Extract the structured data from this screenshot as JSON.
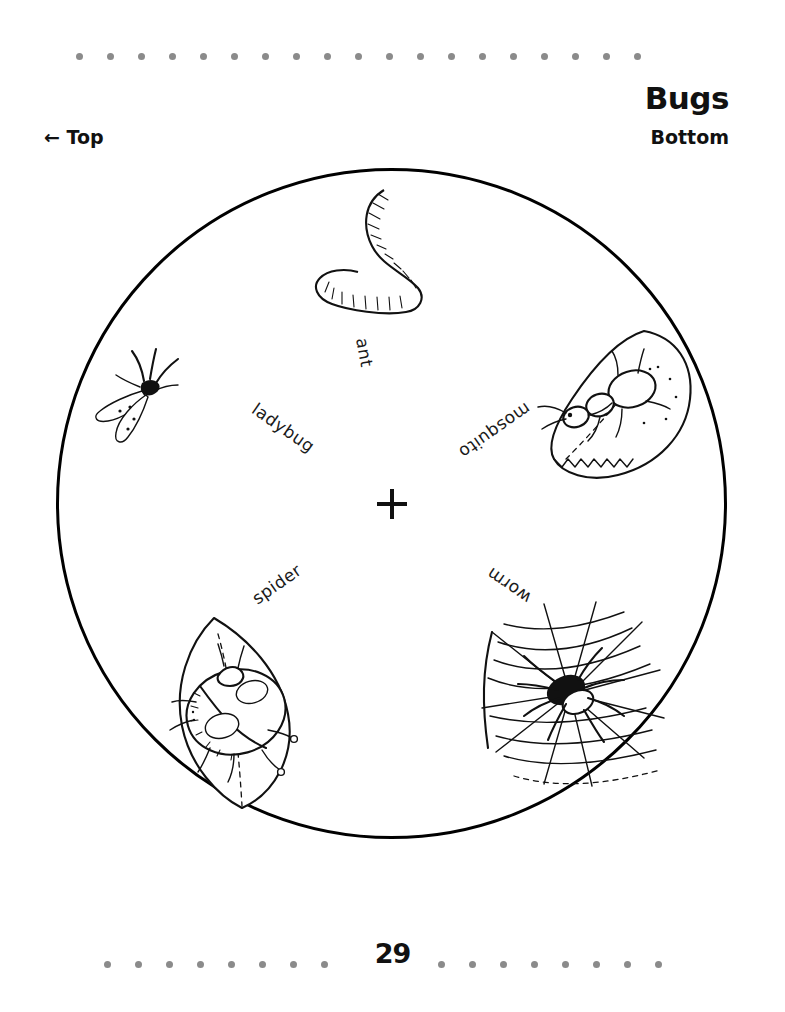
{
  "page": {
    "title": "Bugs",
    "layer_label": "Bottom",
    "top_marker": "← Top",
    "number": "29",
    "background_color": "#ffffff",
    "ink_color": "#111111",
    "dot_color": "#8b8b8b"
  },
  "dot_rules": {
    "top_dot_count": 19,
    "bottom_left_dot_count": 8,
    "bottom_right_dot_count": 8
  },
  "wheel": {
    "center_mark": "plus-crosshair",
    "words": [
      {
        "text": "ladybug",
        "angle_deg": 215,
        "radius_px": 168
      },
      {
        "text": "mosquito",
        "angle_deg": 325,
        "radius_px": 168
      },
      {
        "text": "spider",
        "angle_deg": 145,
        "radius_px": 168
      },
      {
        "text": "worm",
        "angle_deg": 35,
        "radius_px": 168
      },
      {
        "text": "ant",
        "angle_deg": 260,
        "radius_px": 168
      }
    ],
    "illustrations": [
      {
        "name": "earthworm",
        "label": "worm"
      },
      {
        "name": "mosquito",
        "label": "mosquito"
      },
      {
        "name": "ant-on-leaf",
        "label": "ant"
      },
      {
        "name": "ladybug-on-leaf",
        "label": "ladybug"
      },
      {
        "name": "spider-on-web",
        "label": "spider"
      }
    ]
  }
}
